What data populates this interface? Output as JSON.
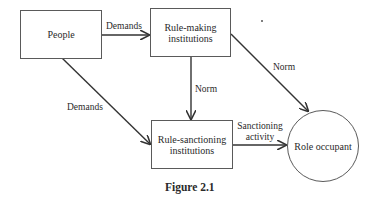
{
  "diagram": {
    "nodes": [
      {
        "id": "people",
        "label": "People",
        "shape": "rect"
      },
      {
        "id": "rule_making",
        "label": "Rule-making\ninstitutions",
        "label_lines": [
          "Rule-making",
          "institutions"
        ],
        "shape": "rect"
      },
      {
        "id": "rule_sanctioning",
        "label": "Rule-sanctioning\ninstitutions",
        "label_lines": [
          "Rule-sanctioning",
          "institutions"
        ],
        "shape": "rect"
      },
      {
        "id": "role_occupant",
        "label": "Role occupant",
        "shape": "circle"
      }
    ],
    "edges": [
      {
        "from": "people",
        "to": "rule_making",
        "label": "Demands"
      },
      {
        "from": "people",
        "to": "rule_sanctioning",
        "label": "Demands"
      },
      {
        "from": "rule_making",
        "to": "rule_sanctioning",
        "label": "Norm"
      },
      {
        "from": "rule_making",
        "to": "role_occupant",
        "label": "Norm"
      },
      {
        "from": "rule_sanctioning",
        "to": "role_occupant",
        "label": "Sanctioning activity",
        "label_lines": [
          "Sanctioning",
          "activity"
        ]
      }
    ],
    "caption": "Figure 2.1",
    "line_color": "#333333",
    "box_border_color": "#5a5a5a"
  }
}
